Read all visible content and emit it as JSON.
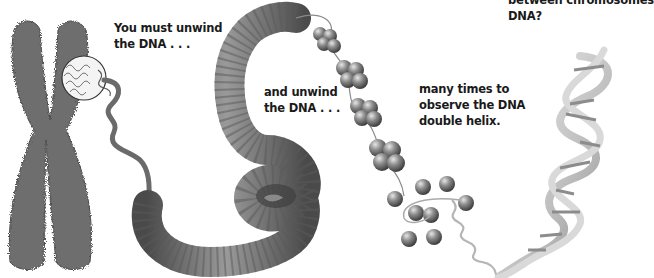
{
  "captions": {
    "top_right": {
      "line1": "between chromosomes",
      "line2": "DNA?"
    },
    "step1": {
      "line1": "You must unwind",
      "line2": "the DNA . . ."
    },
    "step2": {
      "line1": "and unwind",
      "line2": "the DNA . . ."
    },
    "step3": {
      "line1": "many times to",
      "line2": "observe the DNA",
      "line3": "double helix."
    }
  },
  "illustration": {
    "stages": [
      "chromosome",
      "magnified-chromatin-circle",
      "coiled-fiber",
      "nucleosome-clusters",
      "histone-spheres",
      "double-helix"
    ],
    "colors": {
      "chromosome": "#6b6b6b",
      "fiber": "#7d7d7d",
      "nucleosome": "#8a8a8a",
      "helix": "#c8c8c8",
      "text": "#1a1a1a",
      "background": "#ffffff"
    }
  }
}
